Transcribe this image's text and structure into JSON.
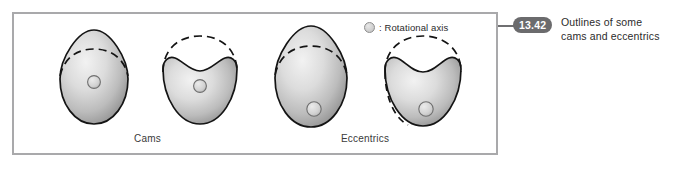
{
  "figure": {
    "number": "13.42",
    "caption_line1": "Outlines of some",
    "caption_line2": "cams and eccentrics"
  },
  "legend": {
    "marker_icon": "rotational-axis-circle-icon",
    "text": ": Rotational axis"
  },
  "groups": {
    "cams_label": "Cams",
    "eccentrics_label": "Eccentrics"
  },
  "colors": {
    "frame_border": "#a9a9ab",
    "badge_background": "#6b6b6d",
    "badge_text": "#ffffff",
    "connector": "#6f6f71",
    "outline": "#111111",
    "shade_light": "#ededed",
    "shade_dark": "#7d7d7d",
    "axis_fill": "#d2d2d2",
    "page_background": "#ffffff"
  },
  "shapes": [
    {
      "name": "cam-egg-centered",
      "group": "Cams",
      "profile": "egg",
      "axis": "centered",
      "dashed_arc": "base-circle-top"
    },
    {
      "name": "cam-dished-centered",
      "group": "Cams",
      "profile": "dished-circle",
      "axis": "centered",
      "dashed_arc": "base-circle-top"
    },
    {
      "name": "eccentric-egg-offset",
      "group": "Eccentrics",
      "profile": "egg",
      "axis": "offset-low",
      "dashed_arc": "base-circle-top"
    },
    {
      "name": "eccentric-dished-offset",
      "group": "Eccentrics",
      "profile": "dished-circle",
      "axis": "offset-low",
      "dashed_arc": "base-circle-top"
    }
  ]
}
